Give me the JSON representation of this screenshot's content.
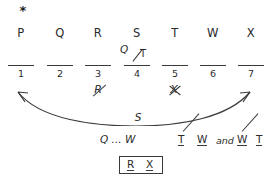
{
  "marker": {
    "symbol": "*",
    "name": "star-icon"
  },
  "letter_row": {
    "letters": [
      {
        "label": "P"
      },
      {
        "label": "Q"
      },
      {
        "label": "R"
      },
      {
        "label": "S"
      },
      {
        "label": "T"
      },
      {
        "label": "W"
      },
      {
        "label": "X"
      }
    ]
  },
  "blanks": {
    "numbers": [
      "1",
      "2",
      "3",
      "4",
      "5",
      "6",
      "7"
    ]
  },
  "slot4_annotation": {
    "numerator": "Q",
    "denominator": "T",
    "separator": "/",
    "note": "Q struck out over T above blank 4"
  },
  "eliminations": [
    {
      "letter": "R",
      "under_blank": "3",
      "mark": "diagonal-strike"
    },
    {
      "letter": "X",
      "under_blank": "5",
      "mark": "cross-out"
    }
  ],
  "arrow": {
    "label": "S",
    "from_blank": "1",
    "to_blank": "7",
    "style": "double-headed-curve"
  },
  "deductions": {
    "ordering": "Q ... W",
    "conjunction": "and",
    "pairs": [
      {
        "left": "T",
        "right": "W",
        "separator": "/",
        "struck": true
      },
      {
        "left": "W",
        "right": "T",
        "separator": "/",
        "struck": true
      }
    ]
  },
  "answer_box": {
    "items": [
      "R",
      "X"
    ]
  },
  "colors": {
    "ink": "#2b2b2b",
    "rule": "#3a3a3a",
    "paper": "#ffffff"
  }
}
